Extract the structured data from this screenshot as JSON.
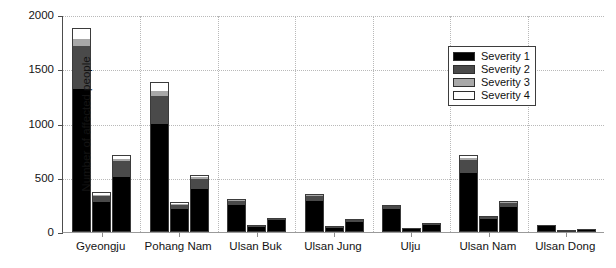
{
  "chart_data": {
    "type": "bar",
    "subtype": "grouped-stacked-bar",
    "title": "",
    "xlabel": "",
    "ylabel": "Number of affected people",
    "ylim": [
      0,
      2000
    ],
    "yticks": [
      0,
      500,
      1000,
      1500,
      2000
    ],
    "ytick_labels": [
      "0",
      "500",
      "1000",
      "1500",
      "2000"
    ],
    "grid": "dotted, horizontal and vertical",
    "legend_position": "upper right",
    "categories": [
      "Gyeongju",
      "Pohang Nam",
      "Ulsan Buk",
      "Ulsan Jung",
      "Ulju",
      "Ulsan Nam",
      "Ulsan Dong"
    ],
    "bars_per_category": 3,
    "series": [
      {
        "name": "Severity 1",
        "color": "#000000",
        "values": [
          [
            1320,
            275,
            510
          ],
          [
            995,
            215,
            395
          ],
          [
            245,
            50,
            110
          ],
          [
            290,
            40,
            95
          ],
          [
            215,
            30,
            65
          ],
          [
            545,
            120,
            230
          ],
          [
            55,
            10,
            20
          ]
        ]
      },
      {
        "name": "Severity 2",
        "color": "#4a4a4a",
        "values": [
          [
            395,
            55,
            140
          ],
          [
            255,
            35,
            95
          ],
          [
            45,
            12,
            15
          ],
          [
            45,
            10,
            15
          ],
          [
            25,
            8,
            10
          ],
          [
            120,
            20,
            40
          ],
          [
            8,
            3,
            5
          ]
        ]
      },
      {
        "name": "Severity 3",
        "color": "#a8a8a8",
        "values": [
          [
            60,
            15,
            25
          ],
          [
            50,
            10,
            15
          ],
          [
            10,
            4,
            5
          ],
          [
            10,
            3,
            5
          ],
          [
            5,
            2,
            3
          ],
          [
            20,
            5,
            10
          ],
          [
            3,
            1,
            2
          ]
        ]
      },
      {
        "name": "Severity 4",
        "color": "#ffffff",
        "values": [
          [
            105,
            25,
            35
          ],
          [
            80,
            15,
            20
          ],
          [
            5,
            2,
            3
          ],
          [
            5,
            2,
            3
          ],
          [
            3,
            1,
            2
          ],
          [
            25,
            5,
            8
          ],
          [
            2,
            1,
            1
          ]
        ]
      }
    ],
    "totals": [
      [
        1880,
        370,
        710
      ],
      [
        1380,
        275,
        525
      ],
      [
        305,
        68,
        133
      ],
      [
        350,
        55,
        118
      ],
      [
        248,
        41,
        80
      ],
      [
        710,
        150,
        288
      ],
      [
        68,
        15,
        28
      ]
    ]
  },
  "axes": {
    "y_title": "Number of affected people",
    "y_tick_labels": [
      "2000",
      "1500",
      "1000",
      "500",
      "0"
    ],
    "x_tick_labels": [
      "Gyeongju",
      "Pohang Nam",
      "Ulsan Buk",
      "Ulsan Jung",
      "Ulju",
      "Ulsan Nam",
      "Ulsan Dong"
    ]
  },
  "legend": {
    "entries": [
      {
        "label": "Severity 1",
        "color": "#000000"
      },
      {
        "label": "Severity 2",
        "color": "#4a4a4a"
      },
      {
        "label": "Severity 3",
        "color": "#a8a8a8"
      },
      {
        "label": "Severity 4",
        "color": "#ffffff"
      }
    ]
  }
}
